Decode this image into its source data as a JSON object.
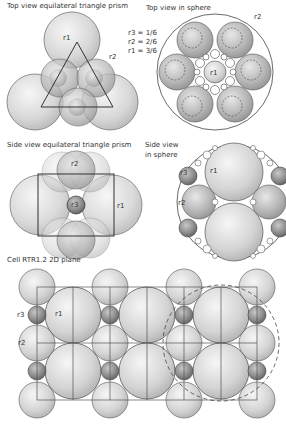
{
  "panels": {
    "top_triangle": {
      "title": "Top view equilateral triangle prism",
      "r1": "r1",
      "r2": "r2"
    },
    "top_sphere": {
      "title": "Top view in sphere",
      "r1": "r1",
      "r2": "r2"
    },
    "legend": {
      "r3": "r3 = 1/6",
      "r2": "r2 = 2/6",
      "r1": "r1 = 3/6"
    },
    "side_triangle": {
      "title": "Side view equilateral triangle prism",
      "r1": "r1",
      "r2": "r2",
      "r3": "r3"
    },
    "side_sphere": {
      "title_line1": "Side view",
      "title_line2": "in sphere",
      "r1": "r1",
      "r2": "r2",
      "r3": "r3"
    },
    "cell": {
      "title": "Cell RTR1.2 2D plane",
      "r1": "r1",
      "r2": "r2",
      "r3": "r3"
    }
  },
  "colors": {
    "sphere_fill": "#d8d8d8",
    "sphere_stroke": "#555555",
    "dark_sphere": "#8a8a8a",
    "line": "#444444"
  }
}
